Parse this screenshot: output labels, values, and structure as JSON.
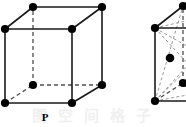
{
  "figure": {
    "background_color": "#ffffff",
    "line_color": "#1a1a1a",
    "hidden_line_color": "#4d4d4d",
    "vertex_color": "#000000",
    "watermark_color": "#f0f0f0",
    "width": 186,
    "height": 127
  },
  "watermark": {
    "text": "图 空 间 格 子",
    "visible": true
  },
  "cells": [
    {
      "id": "primitive-cubic",
      "label": "P",
      "label_x": 45,
      "label_y": 118,
      "lattice_type": "primitive",
      "clipped": false,
      "vertex_count": 8,
      "center_points": 0,
      "vertices": [
        {
          "name": "front-top-left",
          "x": 5,
          "y": 29,
          "hidden": false
        },
        {
          "name": "front-top-right",
          "x": 72,
          "y": 29,
          "hidden": false
        },
        {
          "name": "front-bottom-left",
          "x": 5,
          "y": 103,
          "hidden": false
        },
        {
          "name": "front-bottom-right",
          "x": 72,
          "y": 103,
          "hidden": false
        },
        {
          "name": "back-top-left",
          "x": 33,
          "y": 7,
          "hidden": false
        },
        {
          "name": "back-top-right",
          "x": 102,
          "y": 7,
          "hidden": false
        },
        {
          "name": "back-bottom-left",
          "x": 33,
          "y": 85,
          "hidden": true
        },
        {
          "name": "back-bottom-right",
          "x": 102,
          "y": 85,
          "hidden": false
        }
      ],
      "edges": [
        {
          "from": "front-top-left",
          "to": "front-top-right",
          "style": "solid"
        },
        {
          "from": "front-top-right",
          "to": "front-bottom-right",
          "style": "solid"
        },
        {
          "from": "front-bottom-right",
          "to": "front-bottom-left",
          "style": "solid"
        },
        {
          "from": "front-bottom-left",
          "to": "front-top-left",
          "style": "solid"
        },
        {
          "from": "back-top-left",
          "to": "back-top-right",
          "style": "solid"
        },
        {
          "from": "back-top-right",
          "to": "back-bottom-right",
          "style": "solid"
        },
        {
          "from": "back-bottom-right",
          "to": "back-bottom-left",
          "style": "dashed"
        },
        {
          "from": "back-bottom-left",
          "to": "back-top-left",
          "style": "dashed"
        },
        {
          "from": "front-top-left",
          "to": "back-top-left",
          "style": "solid"
        },
        {
          "from": "front-top-right",
          "to": "back-top-right",
          "style": "solid"
        },
        {
          "from": "front-bottom-left",
          "to": "back-bottom-left",
          "style": "dashed"
        },
        {
          "from": "front-bottom-right",
          "to": "back-bottom-right",
          "style": "solid"
        }
      ]
    },
    {
      "id": "body-centered-cubic",
      "label": "",
      "lattice_type": "body-centered",
      "clipped": true,
      "vertex_count": 8,
      "center_points": 1,
      "vertices": [
        {
          "name": "front-top-left",
          "x": 155,
          "y": 28,
          "hidden": false
        },
        {
          "name": "front-top-right",
          "x": 222,
          "y": 28,
          "hidden": false
        },
        {
          "name": "front-bottom-left",
          "x": 155,
          "y": 101,
          "hidden": false
        },
        {
          "name": "front-bottom-right",
          "x": 222,
          "y": 101,
          "hidden": false
        },
        {
          "name": "back-top-left",
          "x": 183,
          "y": 6,
          "hidden": false
        },
        {
          "name": "back-top-right",
          "x": 252,
          "y": 6,
          "hidden": false
        },
        {
          "name": "back-bottom-left",
          "x": 183,
          "y": 83,
          "hidden": true
        },
        {
          "name": "back-bottom-right",
          "x": 252,
          "y": 83,
          "hidden": false
        },
        {
          "name": "body-center",
          "x": 170,
          "y": 58,
          "hidden": false
        }
      ],
      "edges": [
        {
          "from": "front-top-left",
          "to": "front-top-right",
          "style": "solid"
        },
        {
          "from": "front-top-right",
          "to": "front-bottom-right",
          "style": "solid"
        },
        {
          "from": "front-bottom-right",
          "to": "front-bottom-left",
          "style": "solid"
        },
        {
          "from": "front-bottom-left",
          "to": "front-top-left",
          "style": "solid"
        },
        {
          "from": "back-top-left",
          "to": "back-top-right",
          "style": "solid"
        },
        {
          "from": "back-top-right",
          "to": "back-bottom-right",
          "style": "solid"
        },
        {
          "from": "back-bottom-right",
          "to": "back-bottom-left",
          "style": "dashed"
        },
        {
          "from": "back-bottom-left",
          "to": "back-top-left",
          "style": "dashed"
        },
        {
          "from": "front-top-left",
          "to": "back-top-left",
          "style": "solid"
        },
        {
          "from": "front-top-right",
          "to": "back-top-right",
          "style": "solid"
        },
        {
          "from": "front-bottom-left",
          "to": "back-bottom-left",
          "style": "dashed"
        },
        {
          "from": "front-bottom-right",
          "to": "back-bottom-right",
          "style": "solid"
        }
      ],
      "diagonals": [
        {
          "from": "front-top-left",
          "to": "front-bottom-right"
        },
        {
          "from": "front-top-left",
          "to": "back-bottom-right"
        },
        {
          "from": "front-top-left",
          "to": "back-top-right"
        },
        {
          "from": "front-bottom-left",
          "to": "front-top-right"
        },
        {
          "from": "front-bottom-left",
          "to": "back-top-right"
        },
        {
          "from": "front-bottom-left",
          "to": "back-top-left"
        },
        {
          "from": "front-bottom-left",
          "to": "back-bottom-right"
        },
        {
          "from": "back-top-left",
          "to": "front-top-right"
        }
      ]
    }
  ]
}
